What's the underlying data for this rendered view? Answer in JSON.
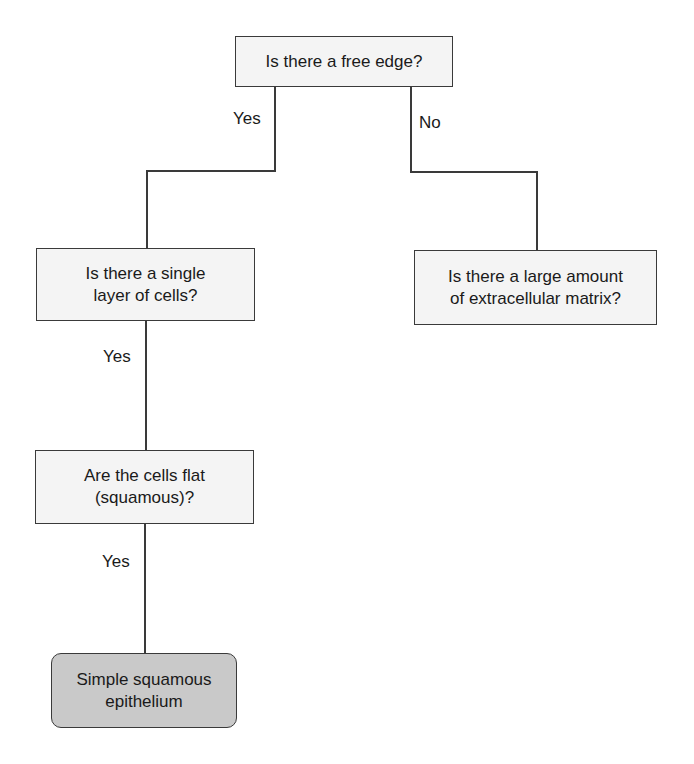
{
  "diagram": {
    "type": "decision-flowchart",
    "nodes": {
      "free_edge": {
        "text": "Is there a free edge?"
      },
      "single_layer": {
        "text": "Is there a single\nlayer of cells?"
      },
      "matrix": {
        "text": "Is there a large amount\nof extracellular matrix?"
      },
      "flat_cells": {
        "text": "Are the cells flat\n(squamous)?"
      },
      "result": {
        "text": "Simple squamous\nepithelium"
      }
    },
    "edge_labels": {
      "free_edge_yes": "Yes",
      "free_edge_no": "No",
      "single_layer_yes": "Yes",
      "flat_cells_yes": "Yes"
    },
    "colors": {
      "box_fill": "#f4f4f4",
      "terminal_fill": "#c9c9c9",
      "line": "#3a3a3a"
    }
  }
}
